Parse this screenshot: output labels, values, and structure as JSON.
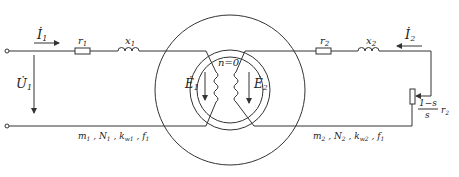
{
  "diagram": {
    "stator": {
      "current_label": "İ",
      "current_sub": "1",
      "voltage_label": "U̇",
      "voltage_sub": "1",
      "resistor_label": "r",
      "resistor_sub": "1",
      "reactance_label": "x",
      "reactance_sub": "1",
      "emf_label": "Ė",
      "emf_sub": "1",
      "params": "m₁ , N₁ , k_w1 , f₁",
      "params_parts": [
        "m",
        "1",
        " , N",
        "1",
        " , k",
        "w1",
        " , f",
        "1"
      ]
    },
    "rotor": {
      "current_label": "İ",
      "current_sub": "2",
      "resistor_label": "r",
      "resistor_sub": "2",
      "reactance_label": "x",
      "reactance_sub": "2",
      "emf_label": "Ė",
      "emf_sub": "2",
      "load_numerator": "1−s",
      "load_denominator": "s",
      "load_label": "r",
      "load_sub": "2",
      "params_parts": [
        "m",
        "2",
        " , N",
        "2",
        " , k",
        "w2",
        " , f",
        "1"
      ]
    },
    "speed_label": "n=0"
  }
}
